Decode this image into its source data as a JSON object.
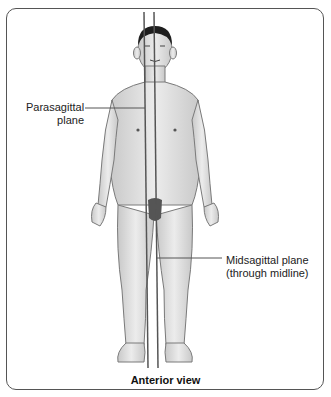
{
  "figure": {
    "labels": {
      "parasagittal": "Parasagittal plane",
      "parasagittal_line1": "Parasagittal",
      "parasagittal_line2": "plane",
      "midsagittal_line1": "Midsagittal plane",
      "midsagittal_line2": "(through midline)"
    },
    "caption": "Anterior view",
    "colors": {
      "frame": "#555555",
      "plane_lines": "#555555",
      "skin": "#d9d9d9",
      "outline": "#7a7a7a",
      "hair": "#1e1e1e"
    }
  }
}
